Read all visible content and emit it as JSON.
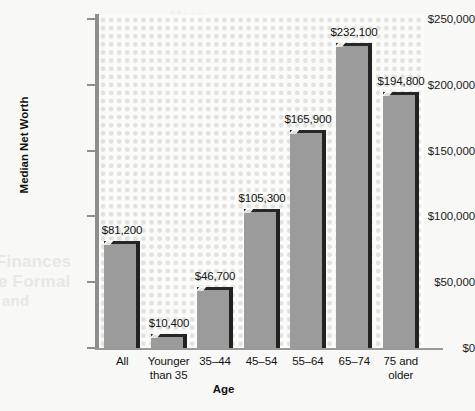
{
  "background_texts": [
    "Finances",
    "e Formal",
    "and",
    "Mean"
  ],
  "chart_data": {
    "type": "bar",
    "title": "",
    "xlabel": "Age",
    "ylabel": "Median Net Worth",
    "categories": [
      "All",
      "Younger than 35",
      "35–44",
      "45–54",
      "55–64",
      "65–74",
      "75 and older"
    ],
    "category_lines": [
      [
        "All"
      ],
      [
        "Younger",
        "than 35"
      ],
      [
        "35–44"
      ],
      [
        "45–54"
      ],
      [
        "55–64"
      ],
      [
        "65–74"
      ],
      [
        "75 and",
        "older"
      ]
    ],
    "values": [
      81200,
      10400,
      46700,
      105300,
      165900,
      232100,
      194800
    ],
    "value_labels": [
      "$81,200",
      "$10,400",
      "$46,700",
      "$105,300",
      "$165,900",
      "$232,100",
      "$194,800"
    ],
    "ylim": [
      0,
      250000
    ],
    "yticks": [
      0,
      50000,
      100000,
      150000,
      200000,
      250000
    ],
    "ytick_labels": [
      "$0",
      "$50,000",
      "$100,000",
      "$150,000",
      "$200,000",
      "$250,000"
    ],
    "grid": false,
    "legend": null,
    "colors": {
      "bar_fill": "#9b9b9b",
      "bar_edge": "#242424",
      "plot_background": "#fbfbfa",
      "dot_pattern": "#e2e2e0",
      "axis": "#8e8e8c",
      "text": "#131313"
    }
  }
}
